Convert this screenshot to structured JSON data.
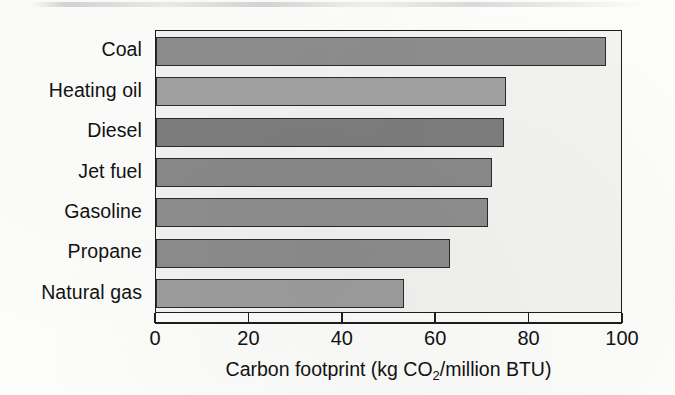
{
  "chart_data": {
    "type": "bar",
    "orientation": "horizontal",
    "title": "",
    "xlabel": "Carbon footprint (kg CO2/million BTU)",
    "xlabel_parts": {
      "before_sub": "Carbon footprint (kg CO",
      "sub": "2",
      "after_sub": "/million BTU)"
    },
    "ylabel": "",
    "categories": [
      "Coal",
      "Heating oil",
      "Diesel",
      "Jet fuel",
      "Gasoline",
      "Propane",
      "Natural gas"
    ],
    "values": [
      96.4,
      75.0,
      74.5,
      72.0,
      71.0,
      63.0,
      53.0
    ],
    "bar_colors": [
      "#8d8d8d",
      "#a2a2a2",
      "#7d7d7d",
      "#898989",
      "#8e8e8e",
      "#8c8c8c",
      "#9d9d9d"
    ],
    "bar_outline_color": "#2a2a2a",
    "plot_background": "#f3f3f1",
    "xlim": [
      0,
      100
    ],
    "xticks": [
      0,
      20,
      40,
      60,
      80,
      100
    ],
    "xtick_labels": [
      "0",
      "20",
      "40",
      "60",
      "80",
      "100"
    ],
    "grid": false,
    "legend": false,
    "axis_color": "#1d1d1d"
  }
}
